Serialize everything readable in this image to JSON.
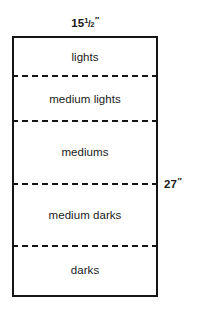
{
  "diagram": {
    "shape": "rectangle",
    "stroke_color": "#151515",
    "fill_color": "#ffffff",
    "text_color": "#1a1a1a",
    "divider_style": "dashed",
    "dimensions": {
      "width_label": "15½″",
      "width_whole": "15",
      "width_fraction_numerator": "1",
      "width_fraction_bar": "/",
      "width_fraction_denominator": "2",
      "width_unit": "″",
      "height_label": "27″",
      "height_value": "27",
      "height_unit": "″"
    },
    "bands": [
      {
        "label": "lights"
      },
      {
        "label": "medium lights"
      },
      {
        "label": "mediums"
      },
      {
        "label": "medium darks"
      },
      {
        "label": "darks"
      }
    ]
  }
}
